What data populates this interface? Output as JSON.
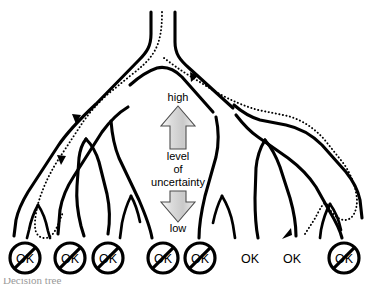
{
  "figure": {
    "type": "decision-tree-uncertainty-diagram",
    "background_color": "#ffffff",
    "line_color": "#000000",
    "caption_fragment": "Decision tree"
  },
  "gauge": {
    "top_label": "high",
    "bottom_label": "low",
    "middle_line_1": "level",
    "middle_line_2": "of",
    "middle_line_3": "uncertainty",
    "fill_color": "#d4d4d4",
    "outline_color": "#4d4d4d"
  },
  "leaves": [
    {
      "id": "leaf-1",
      "label": "OK",
      "crossed_out": true,
      "x": 25
    },
    {
      "id": "leaf-2",
      "label": "OK",
      "crossed_out": true,
      "x": 70
    },
    {
      "id": "leaf-3",
      "label": "OK",
      "crossed_out": true,
      "x": 108
    },
    {
      "id": "leaf-4",
      "label": "OK",
      "crossed_out": true,
      "x": 163
    },
    {
      "id": "leaf-5",
      "label": "OK",
      "crossed_out": true,
      "x": 200
    },
    {
      "id": "leaf-6",
      "label": "OK",
      "crossed_out": false,
      "x": 250
    },
    {
      "id": "leaf-7",
      "label": "OK",
      "crossed_out": false,
      "x": 292
    },
    {
      "id": "leaf-8",
      "label": "OK",
      "crossed_out": true,
      "x": 344
    }
  ],
  "path_markers": [
    {
      "id": "arrow-top-right",
      "direction": "down-right"
    },
    {
      "id": "arrow-upper-left",
      "direction": "down-left"
    },
    {
      "id": "arrow-lower-left",
      "direction": "down-left"
    },
    {
      "id": "arrow-bottom-right",
      "direction": "down-left"
    }
  ]
}
